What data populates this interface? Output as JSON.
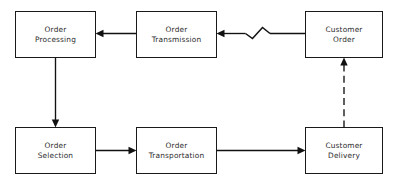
{
  "diagram": {
    "background_color": "#ffffff",
    "line_color": "#111111",
    "box_stroke_color": "#1a1a1a",
    "text_color": "#2b2b2b",
    "nodes": [
      {
        "id": "order-processing",
        "line1": "Order",
        "line2": "Processing",
        "x": 15,
        "y": 11,
        "w": 80,
        "h": 46
      },
      {
        "id": "order-transmission",
        "line1": "Order",
        "line2": "Transmission",
        "x": 136,
        "y": 11,
        "w": 80,
        "h": 46
      },
      {
        "id": "customer-order",
        "line1": "Customer",
        "line2": "Order",
        "x": 305,
        "y": 11,
        "w": 77,
        "h": 46
      },
      {
        "id": "order-selection",
        "line1": "Order",
        "line2": "Selection",
        "x": 15,
        "y": 127,
        "w": 80,
        "h": 46
      },
      {
        "id": "order-transportation",
        "line1": "Order",
        "line2": "Transportation",
        "x": 136,
        "y": 127,
        "w": 80,
        "h": 46
      },
      {
        "id": "customer-delivery",
        "line1": "Customer",
        "line2": "Delivery",
        "x": 305,
        "y": 127,
        "w": 77,
        "h": 46
      }
    ],
    "connectors": [
      {
        "id": "customer-order-to-order-transmission",
        "from": "customer-order",
        "to": "order-transmission",
        "style": "solid-with-break",
        "direction": "left"
      },
      {
        "id": "order-transmission-to-order-processing",
        "from": "order-transmission",
        "to": "order-processing",
        "style": "solid",
        "direction": "left"
      },
      {
        "id": "order-processing-to-order-selection",
        "from": "order-processing",
        "to": "order-selection",
        "style": "solid",
        "direction": "down"
      },
      {
        "id": "order-selection-to-order-transportation",
        "from": "order-selection",
        "to": "order-transportation",
        "style": "solid",
        "direction": "right"
      },
      {
        "id": "order-transportation-to-customer-delivery",
        "from": "order-transportation",
        "to": "customer-delivery",
        "style": "solid",
        "direction": "right"
      },
      {
        "id": "customer-delivery-to-customer-order",
        "from": "customer-delivery",
        "to": "customer-order",
        "style": "dashed",
        "direction": "up"
      }
    ]
  }
}
